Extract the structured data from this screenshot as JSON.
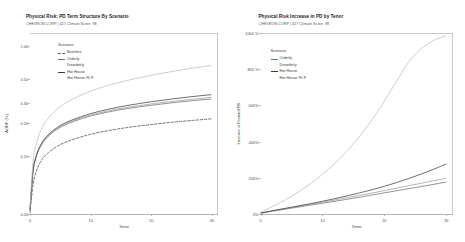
{
  "panels": [
    {
      "title": "Physical Risk: PD Term Structure By Scenario",
      "subtitle": "CHEVRON CORP | 427 Climate Score: 98",
      "legend_title": "Scenario",
      "xlabel": "Tenor",
      "ylabel": "AODF (%)",
      "yticks": [
        "1.00",
        "0.50",
        "0.30",
        "0.20",
        "0.10",
        "0.03"
      ],
      "xticks": [
        "0",
        "10",
        "20",
        "30"
      ],
      "legend": [
        {
          "label": "Baseline",
          "color": "#555555",
          "dash": "dashed"
        },
        {
          "label": "Orderly",
          "color": "#6e6e6e",
          "dash": "solid"
        },
        {
          "label": "Disorderly",
          "color": "#9a9a9a",
          "dash": "solid"
        },
        {
          "label": "Hot House",
          "color": "#3c3c3c",
          "dash": "solid"
        },
        {
          "label": "Hot House 95 F",
          "color": "#bdbdbd",
          "dash": "solid"
        }
      ]
    },
    {
      "title": "Physical Risk Increase in PD by Tenor",
      "subtitle": "CHEVRON CORP | 427 Climate Score: 98",
      "legend_title": "Scenario",
      "xlabel": "Tenor",
      "ylabel": "Increase in Forward PD",
      "yticks": [
        "1000 %",
        "800 %",
        "600%",
        "400%",
        "200%",
        "0%"
      ],
      "xticks": [
        "0",
        "10",
        "20",
        "30"
      ],
      "legend": [
        {
          "label": "Orderly",
          "color": "#6e6e6e",
          "dash": "solid"
        },
        {
          "label": "Disorderly",
          "color": "#9a9a9a",
          "dash": "solid"
        },
        {
          "label": "Hot House",
          "color": "#3c3c3c",
          "dash": "solid"
        },
        {
          "label": "Hot House 95 F",
          "color": "#bdbdbd",
          "dash": "solid"
        }
      ]
    }
  ],
  "chart_data": [
    {
      "type": "line",
      "title": "Physical Risk: PD Term Structure By Scenario",
      "subtitle": "CHEVRON CORP | 427 Climate Score: 98",
      "xlabel": "Tenor",
      "ylabel": "AODF (%)",
      "yscale": "log",
      "ylim": [
        0.03,
        1.3
      ],
      "xlim": [
        0,
        31
      ],
      "yticks": [
        1.0,
        0.5,
        0.3,
        0.2,
        0.1,
        0.03
      ],
      "xticks": [
        0,
        10,
        20,
        30
      ],
      "grid": false,
      "legend_position": "upper-left",
      "x": [
        0,
        0.5,
        1,
        2,
        3,
        5,
        7,
        10,
        13,
        16,
        20,
        24,
        27,
        30
      ],
      "series": [
        {
          "name": "Baseline",
          "style": "dashed",
          "color": "#555555",
          "values": [
            0.031,
            0.055,
            0.072,
            0.094,
            0.108,
            0.128,
            0.142,
            0.159,
            0.172,
            0.183,
            0.195,
            0.206,
            0.213,
            0.22
          ]
        },
        {
          "name": "Orderly",
          "style": "solid",
          "color": "#6e6e6e",
          "values": [
            0.033,
            0.072,
            0.098,
            0.13,
            0.152,
            0.184,
            0.206,
            0.233,
            0.254,
            0.272,
            0.292,
            0.31,
            0.322,
            0.333
          ]
        },
        {
          "name": "Disorderly",
          "style": "solid",
          "color": "#9a9a9a",
          "values": [
            0.033,
            0.073,
            0.099,
            0.132,
            0.154,
            0.187,
            0.21,
            0.238,
            0.26,
            0.279,
            0.3,
            0.319,
            0.332,
            0.344
          ]
        },
        {
          "name": "Hot House",
          "style": "solid",
          "color": "#3c3c3c",
          "values": [
            0.033,
            0.074,
            0.1,
            0.134,
            0.157,
            0.191,
            0.215,
            0.245,
            0.269,
            0.29,
            0.314,
            0.336,
            0.351,
            0.365
          ]
        },
        {
          "name": "Hot House 95 F",
          "style": "solid",
          "color": "#bdbdbd",
          "values": [
            0.034,
            0.09,
            0.128,
            0.182,
            0.222,
            0.284,
            0.331,
            0.392,
            0.444,
            0.49,
            0.546,
            0.599,
            0.636,
            0.672
          ]
        }
      ]
    },
    {
      "type": "line",
      "title": "Physical Risk Increase in PD by Tenor",
      "subtitle": "CHEVRON CORP | 427 Climate Score: 98",
      "xlabel": "Tenor",
      "ylabel": "Increase in Forward PD",
      "ylim": [
        0,
        1100
      ],
      "xlim": [
        0,
        31
      ],
      "yticks": [
        0,
        200,
        400,
        600,
        800,
        1000
      ],
      "xticks": [
        0,
        10,
        20,
        30
      ],
      "grid": false,
      "legend_position": "upper-left",
      "x": [
        0,
        2,
        4,
        6,
        8,
        10,
        12,
        14,
        16,
        18,
        20,
        22,
        24,
        26,
        28,
        30
      ],
      "series": [
        {
          "name": "Orderly",
          "style": "solid",
          "color": "#6e6e6e",
          "values": [
            5,
            18,
            30,
            42,
            54,
            66,
            78,
            90,
            103,
            116,
            129,
            142,
            155,
            168,
            181,
            195
          ]
        },
        {
          "name": "Disorderly",
          "style": "solid",
          "color": "#9a9a9a",
          "values": [
            6,
            20,
            33,
            46,
            59,
            72,
            86,
            100,
            114,
            128,
            143,
            158,
            173,
            188,
            203,
            218
          ]
        },
        {
          "name": "Hot House",
          "style": "solid",
          "color": "#3c3c3c",
          "values": [
            6,
            21,
            35,
            49,
            63,
            78,
            94,
            111,
            129,
            148,
            169,
            192,
            217,
            244,
            273,
            305
          ]
        },
        {
          "name": "Hot House 95 F",
          "style": "solid",
          "color": "#bdbdbd",
          "values": [
            12,
            48,
            88,
            133,
            184,
            243,
            310,
            387,
            475,
            575,
            688,
            812,
            930,
            1010,
            1060,
            1090
          ]
        }
      ]
    }
  ]
}
